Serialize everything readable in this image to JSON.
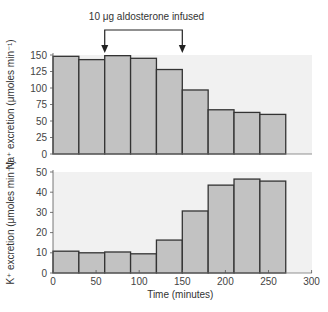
{
  "annotation": "10 μg aldosterone infused",
  "chart_data": [
    {
      "type": "bar",
      "title": "",
      "xlabel": "",
      "ylabel": "Na⁺ excretion (μmoles min⁻¹)",
      "bin_width_minutes": 30,
      "x_bin_starts": [
        0,
        30,
        60,
        90,
        120,
        150,
        180,
        210,
        240
      ],
      "values": [
        148,
        143,
        149,
        145,
        128,
        97,
        67,
        63,
        60
      ],
      "ylim": [
        0,
        150
      ],
      "yticks": [
        "0",
        "25",
        "50",
        "75",
        "100",
        "125",
        "150"
      ],
      "annotation": {
        "text": "10 μg aldosterone infused",
        "from_minutes": 60,
        "to_minutes": 150
      }
    },
    {
      "type": "bar",
      "title": "",
      "xlabel": "Time (minutes)",
      "ylabel": "K⁺ excretion (μmoles min⁻¹)",
      "bin_width_minutes": 30,
      "x_bin_starts": [
        0,
        30,
        60,
        90,
        120,
        150,
        180,
        210,
        240
      ],
      "values": [
        10.8,
        10,
        10.4,
        9.5,
        16.3,
        30.7,
        43.5,
        46.5,
        45.5
      ],
      "ylim": [
        0,
        50
      ],
      "yticks": [
        "0",
        "10",
        "20",
        "30",
        "40",
        "50"
      ],
      "xlim": [
        0,
        300
      ],
      "xticks": [
        "0",
        "50",
        "100",
        "150",
        "200",
        "250",
        "300"
      ]
    }
  ],
  "labels": {
    "na_ylabel": "Na⁺ excretion (μmoles min⁻¹)",
    "k_ylabel": "K⁺ excretion (μmoles min⁻¹)",
    "xlabel": "Time (minutes)"
  },
  "colors": {
    "bar_fill": "#c2c2c2",
    "bar_stroke": "#333333",
    "plot_bg": "#f1f1f1"
  }
}
